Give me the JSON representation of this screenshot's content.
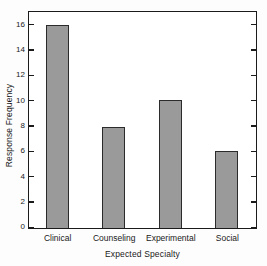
{
  "chart_data": {
    "type": "bar",
    "title": "",
    "xlabel": "Expected Specialty",
    "ylabel": "Response Frequency",
    "categories": [
      "Clinical",
      "Counseling",
      "Experimental",
      "Social"
    ],
    "values": [
      16,
      8,
      10.1,
      6.1
    ],
    "ylim": [
      0,
      17
    ],
    "yticks": [
      0,
      2,
      4,
      6,
      8,
      10,
      12,
      14,
      16
    ],
    "ytick_labels": [
      "0",
      "2",
      "4",
      "6",
      "8",
      "10",
      "12",
      "14",
      "16"
    ],
    "grid": false,
    "legend": false,
    "legend_position": "none",
    "bar_color": "#9a9a9a",
    "bar_edge_color": "#2b2b2b",
    "axis_color": "#1b1b1b",
    "background_color": "#ffffff"
  }
}
